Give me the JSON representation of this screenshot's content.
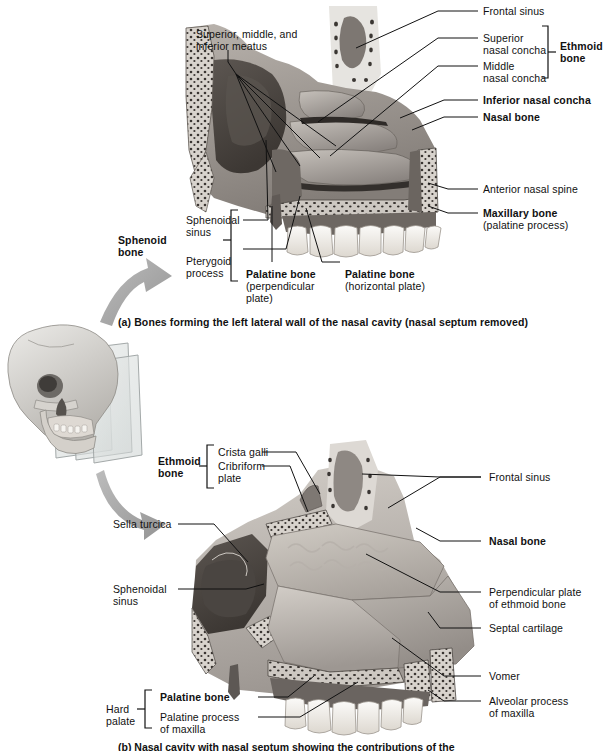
{
  "figure": {
    "panels": [
      {
        "id": "a",
        "caption": "(a) Bones forming the left lateral wall of the nasal cavity (nasal septum removed)"
      },
      {
        "id": "b",
        "caption": "(b) Nasal cavity with nasal septum showing the contributions of the ethmoid bone,"
      }
    ]
  },
  "panel_a": {
    "labels": {
      "meatus": "Superior, middle, and\ninferior meatus",
      "frontal_sinus": "Frontal sinus",
      "superior_nasal_concha": "Superior\nnasal concha",
      "middle_nasal_concha": "Middle\nnasal concha",
      "ethmoid_bone": "Ethmoid\nbone",
      "inferior_nasal_concha": "Inferior nasal concha",
      "nasal_bone": "Nasal bone",
      "anterior_nasal_spine": "Anterior nasal spine",
      "maxillary_bone": "Maxillary bone",
      "maxillary_bone_sub": "(palatine process)",
      "sphenoid_bone": "Sphenoid\nbone",
      "sphenoidal_sinus": "Sphenoidal\nsinus",
      "pterygoid_process": "Pterygoid\nprocess",
      "palatine_bone_perp": "Palatine bone",
      "palatine_bone_perp_sub": "(perpendicular\nplate)",
      "palatine_bone_horiz": "Palatine bone",
      "palatine_bone_horiz_sub": "(horizontal plate)"
    }
  },
  "panel_b": {
    "labels": {
      "ethmoid_bone": "Ethmoid\nbone",
      "crista_galli": "Crista galli",
      "cribriform_plate": "Cribriform\nplate",
      "frontal_sinus": "Frontal sinus",
      "sella_turcica": "Sella turcica",
      "nasal_bone": "Nasal bone",
      "sphenoidal_sinus": "Sphenoidal\nsinus",
      "perpendicular_plate": "Perpendicular plate\nof ethmoid bone",
      "septal_cartilage": "Septal cartilage",
      "vomer": "Vomer",
      "hard_palate": "Hard\npalate",
      "palatine_bone": "Palatine bone",
      "palatine_process": "Palatine process\nof maxilla",
      "alveolar_process": "Alveolar process\nof maxilla"
    }
  },
  "icons": {
    "skull": "skull-illustration",
    "arrow_upper": "curved-arrow-up-icon",
    "arrow_lower": "curved-arrow-down-icon",
    "plane": "sagittal-section-plane"
  },
  "colors": {
    "line": "#111111",
    "bone_light": "#cfcac4",
    "bone_mid": "#a39d98",
    "bone_dark": "#6d6763",
    "cavity": "#4a4440",
    "teeth": "#f2f0ec",
    "arrow": "#a8a8a8",
    "background": "#ffffff"
  }
}
